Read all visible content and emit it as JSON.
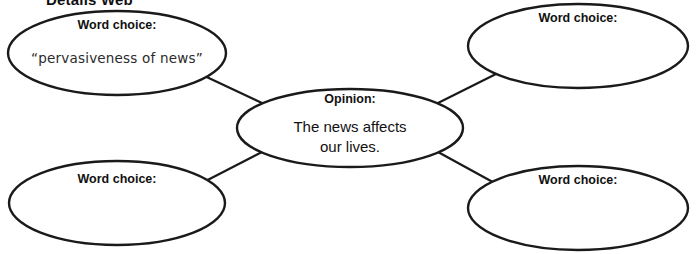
{
  "page": {
    "title": "Details Web",
    "background_color": "#ffffff",
    "line_color": "#1a1a1a",
    "text_color": "#111111"
  },
  "diagram": {
    "type": "web-graphic-organizer",
    "center": {
      "label": "Opinion:",
      "body_line1": "The news affects",
      "body_line2": "our lives."
    },
    "nodes": [
      {
        "position": "top-left",
        "label": "Word choice:",
        "body": "“pervasiveness of news”",
        "filled": true
      },
      {
        "position": "top-right",
        "label": "Word choice:",
        "body": "",
        "filled": false
      },
      {
        "position": "bottom-left",
        "label": "Word choice:",
        "body": "",
        "filled": false
      },
      {
        "position": "bottom-right",
        "label": "Word choice:",
        "body": "",
        "filled": false
      }
    ]
  }
}
